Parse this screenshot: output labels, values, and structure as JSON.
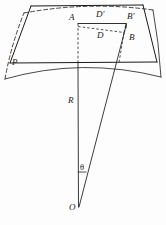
{
  "figure": {
    "background_color": "#fdfdfd",
    "stroke_color": "#1a1a1a",
    "labels": {
      "plane_p": "P",
      "point_a": "A",
      "point_b": "B",
      "point_b_prime": "B'",
      "point_d": "D",
      "point_d_prime": "D'",
      "radius_r": "R",
      "angle_theta": "θ",
      "center_o": "O"
    },
    "label_positions": {
      "plane_p": {
        "x": 12,
        "y": 62
      },
      "point_a": {
        "x": 71,
        "y": 18
      },
      "point_d_prime": {
        "x": 98,
        "y": 14
      },
      "point_b_prime": {
        "x": 121,
        "y": 17
      },
      "point_d": {
        "x": 99,
        "y": 35
      },
      "point_b": {
        "x": 122,
        "y": 36
      },
      "radius_r": {
        "x": 70,
        "y": 100
      },
      "angle_theta": {
        "x": 79,
        "y": 166
      },
      "center_o": {
        "x": 71,
        "y": 203
      }
    },
    "geometry": {
      "plane_quad": "10,63 L 157,62 L 143,6 L 31,7 Z",
      "plane_bottom_edge": {
        "x1": 10,
        "y1": 63,
        "x2": 157,
        "y2": 62
      },
      "surface_lower_arc": "M 6,78 Q 82,58 160,76",
      "surface_upper_arc": "M 23,12 Q 88,0 152,10",
      "surface_left_edge": "M 6,78 Q 12,44 23,12",
      "surface_right_edge": "M 160,76 Q 158,42 152,10",
      "rect_solid_top": {
        "x1": 78,
        "y1": 23,
        "x2": 126,
        "y2": 23
      },
      "rect_dashed_left": {
        "x1": 78,
        "y1": 23,
        "x2": 78,
        "y2": 63
      },
      "rect_dashed_inner_top": "M 78,26 L 123,32",
      "rect_dashed_inner_right": "M 123,32 L 126,23",
      "rect_dashed_down_right": "M 123,32 L 118,63",
      "radius_line": {
        "x1": 78,
        "y1": 63,
        "x2": 78,
        "y2": 207
      },
      "slant_line": {
        "x1": 126,
        "y1": 23,
        "x2": 79,
        "y2": 207
      },
      "angle_tick": {
        "x1": 78,
        "y1": 172,
        "x2": 85,
        "y2": 172
      },
      "center_point": {
        "x": 78,
        "y": 207
      }
    }
  }
}
